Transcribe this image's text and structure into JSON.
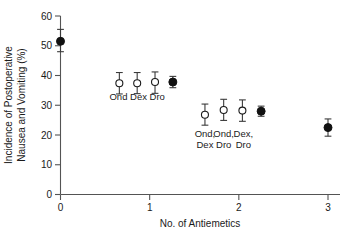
{
  "chart_data": {
    "type": "scatter",
    "title": "",
    "xlabel": "No. of Antiemetics",
    "ylabel_line1": "Incidence of Postoperative",
    "ylabel_line2": "Nausea and Vomiting (%)",
    "xlim": [
      -0.12,
      3.22
    ],
    "ylim": [
      0,
      60
    ],
    "xticks": [
      "0",
      "1",
      "2",
      "3"
    ],
    "xtick_values": [
      0,
      1,
      2,
      3
    ],
    "yticks": [
      "0",
      "10",
      "20",
      "30",
      "40",
      "50",
      "60"
    ],
    "ytick_values": [
      0,
      10,
      20,
      30,
      40,
      50,
      60
    ],
    "grid": false,
    "legend": "none",
    "marker_semantics": {
      "open_circle": "individual antiemetic regimen",
      "filled_circle": "pooled estimate for number of antiemetics"
    },
    "points": [
      {
        "name": "no-antiemetic-pooled",
        "marker": "filled",
        "x": 0.0,
        "y": 51.5,
        "low": 48.0,
        "high": 55.5,
        "label": ""
      },
      {
        "name": "ond",
        "marker": "open",
        "x": 0.66,
        "y": 37.4,
        "low": 33.8,
        "high": 41.0,
        "label": "Ond"
      },
      {
        "name": "dex",
        "marker": "open",
        "x": 0.86,
        "y": 37.4,
        "low": 33.9,
        "high": 41.0,
        "label": "Dex"
      },
      {
        "name": "dro",
        "marker": "open",
        "x": 1.06,
        "y": 37.8,
        "low": 34.0,
        "high": 41.2,
        "label": "Dro"
      },
      {
        "name": "one-antiemetic-pooled",
        "marker": "filled",
        "x": 1.26,
        "y": 37.8,
        "low": 35.9,
        "high": 39.7,
        "label": ""
      },
      {
        "name": "ond-dex",
        "marker": "open",
        "x": 1.62,
        "y": 26.8,
        "low": 23.3,
        "high": 30.4,
        "label": "Ond, Dex"
      },
      {
        "name": "ond-dro",
        "marker": "open",
        "x": 1.83,
        "y": 28.4,
        "low": 24.9,
        "high": 32.0,
        "label": "Ond, Dro"
      },
      {
        "name": "dex-dro",
        "marker": "open",
        "x": 2.04,
        "y": 28.2,
        "low": 24.6,
        "high": 31.8,
        "label": "Dex, Dro"
      },
      {
        "name": "two-antiemetic-pooled",
        "marker": "filled",
        "x": 2.25,
        "y": 28.0,
        "low": 26.3,
        "high": 29.7,
        "label": ""
      },
      {
        "name": "three-antiemetic-pooled",
        "marker": "filled",
        "x": 3.0,
        "y": 22.5,
        "low": 19.6,
        "high": 25.4,
        "label": ""
      }
    ],
    "group_annotations": [
      {
        "name": "one-drug-labels",
        "lines": [
          "Ond  Dex Dro"
        ],
        "x_center": 0.86,
        "y": 31.8
      },
      {
        "name": "two-drug-labels-row1",
        "lines": [
          "Ond,",
          "Dex"
        ],
        "x_center": 1.62,
        "y": 19.3
      },
      {
        "name": "two-drug-labels-row2",
        "lines": [
          "Ond,",
          "Dro"
        ],
        "x_center": 1.83,
        "y": 19.3
      },
      {
        "name": "two-drug-labels-row3",
        "lines": [
          "Dex,",
          "Dro"
        ],
        "x_center": 2.05,
        "y": 19.3
      }
    ]
  }
}
